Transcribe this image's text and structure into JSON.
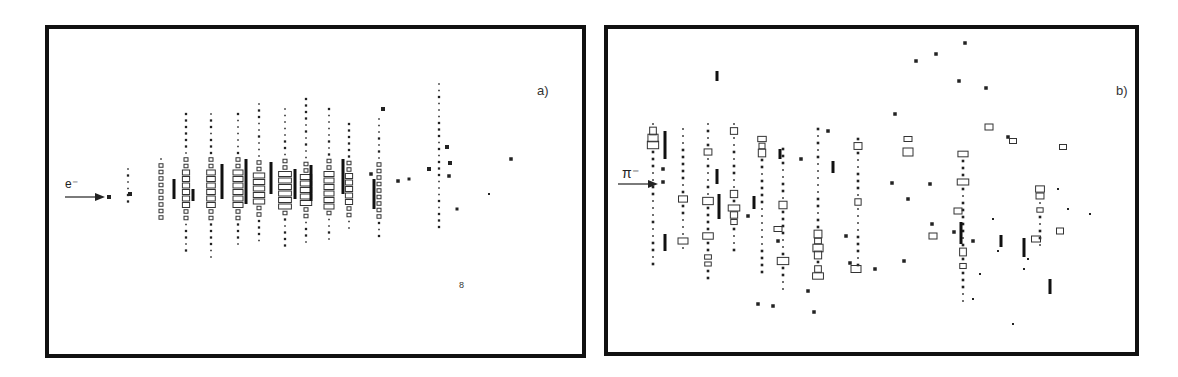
{
  "figure": {
    "panels": [
      {
        "id": "a",
        "label": "a)",
        "particle": "e⁻",
        "beam_arrow": "right-arrow",
        "description": "Electron shower event display: cell hits as dots, filled squares and open rectangles (size ~ energy)"
      },
      {
        "id": "b",
        "label": "b)",
        "particle": "π⁻",
        "beam_arrow": "right-arrow",
        "description": "Pion shower event display: scattered cell hits as dots, filled squares and open rectangles"
      }
    ],
    "stray_mark_a": "8"
  },
  "colors": {
    "ink": "#111111",
    "frame": "#111111",
    "background": "#ffffff"
  }
}
